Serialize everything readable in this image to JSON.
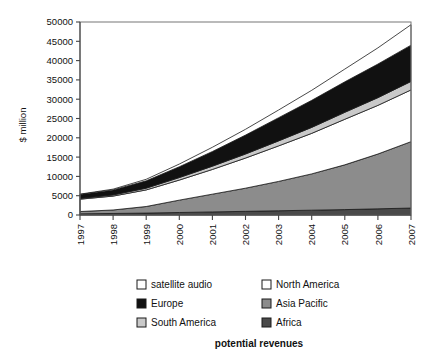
{
  "chart_data": {
    "type": "area",
    "stacked": true,
    "title": "potential revenues",
    "xlabel": "",
    "ylabel": "$ million",
    "x": [
      "1997",
      "1998",
      "1999",
      "2000",
      "2001",
      "2002",
      "2003",
      "2004",
      "2005",
      "2006",
      "2007"
    ],
    "categories": [
      "1997",
      "1998",
      "1999",
      "2000",
      "2001",
      "2002",
      "2003",
      "2004",
      "2005",
      "2006",
      "2007"
    ],
    "ylim": [
      0,
      50000
    ],
    "yticks": [
      0,
      5000,
      10000,
      15000,
      20000,
      25000,
      30000,
      35000,
      40000,
      45000,
      50000
    ],
    "yticklabels": [
      "0",
      "5000",
      "10000",
      "15000",
      "20000",
      "25000",
      "30000",
      "35000",
      "40000",
      "45000",
      "50000"
    ],
    "grid": false,
    "legend_position": "bottom",
    "legend_entries": [
      "satellite audio",
      "North America",
      "Europe",
      "Asia Pacific",
      "South America",
      "Africa"
    ],
    "stack_order_bottom_to_top": [
      "Africa",
      "Asia Pacific",
      "North America",
      "South America",
      "Europe",
      "satellite audio"
    ],
    "series": [
      {
        "name": "Africa",
        "color": "#4a4a4a",
        "values": [
          300,
          400,
          500,
          650,
          800,
          950,
          1100,
          1250,
          1400,
          1600,
          1800
        ]
      },
      {
        "name": "Asia Pacific",
        "color": "#8c8c8c",
        "values": [
          600,
          900,
          1700,
          3200,
          4600,
          6000,
          7600,
          9400,
          11600,
          14200,
          17200
        ]
      },
      {
        "name": "North America",
        "color": "#ffffff",
        "values": [
          3200,
          3600,
          4300,
          5200,
          6400,
          7800,
          9200,
          10500,
          11800,
          12600,
          13400
        ]
      },
      {
        "name": "South America",
        "color": "#c9c9c9",
        "values": [
          200,
          300,
          450,
          650,
          850,
          1050,
          1300,
          1550,
          1800,
          2000,
          2200
        ]
      },
      {
        "name": "Europe",
        "color": "#111111",
        "values": [
          1000,
          1300,
          1900,
          2800,
          3800,
          4900,
          6000,
          7000,
          7900,
          8700,
          9400
        ]
      },
      {
        "name": "satellite audio",
        "color": "#ffffff",
        "values": [
          100,
          200,
          400,
          700,
          1100,
          1500,
          2000,
          2600,
          3300,
          4200,
          5300
        ]
      }
    ],
    "totals": [
      5400,
      6700,
      9250,
      13200,
      17550,
      22200,
      27200,
      32300,
      37800,
      43300,
      49300
    ]
  },
  "legend": {
    "items": [
      {
        "label": "satellite audio",
        "swatch": "#ffffff"
      },
      {
        "label": "North America",
        "swatch": "#ffffff"
      },
      {
        "label": "Europe",
        "swatch": "#111111"
      },
      {
        "label": "Asia Pacific",
        "swatch": "#8c8c8c"
      },
      {
        "label": "South America",
        "swatch": "#c9c9c9"
      },
      {
        "label": "Africa",
        "swatch": "#4a4a4a"
      }
    ]
  }
}
